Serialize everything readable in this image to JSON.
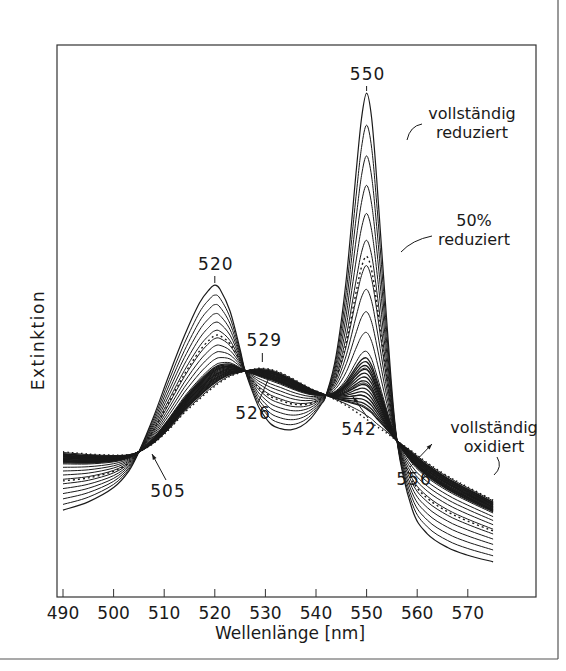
{
  "chart_data": {
    "type": "line",
    "title": "",
    "xlabel": "Wellenlänge [nm]",
    "ylabel": "Extinktion",
    "xlim": [
      490,
      575
    ],
    "ylim": [
      0,
      100
    ],
    "grid": false,
    "legend": "none (inline annotations)",
    "x_ticks": [
      490,
      500,
      510,
      520,
      530,
      540,
      550,
      560,
      570
    ],
    "y_ticks": [],
    "n_intermediate_curves": 16,
    "x": [
      490,
      495,
      500,
      503,
      505,
      508,
      511,
      514,
      517,
      519,
      520,
      521,
      523,
      525,
      526,
      528,
      529,
      531,
      533,
      535,
      537,
      539,
      541,
      542,
      544,
      546,
      548,
      549,
      550,
      551,
      552,
      554,
      556,
      559,
      562,
      566,
      570,
      575
    ],
    "series": [
      {
        "name": "vollständig oxidiert",
        "style": "dotted",
        "values": [
          26.4,
          26.0,
          25.8,
          25.9,
          26.4,
          28.0,
          30.5,
          33.5,
          36.0,
          37.6,
          38.3,
          39.0,
          40.1,
          40.8,
          41.1,
          41.5,
          41.6,
          41.4,
          40.8,
          39.9,
          38.9,
          37.9,
          37.1,
          36.7,
          35.8,
          34.8,
          33.6,
          33.0,
          32.3,
          31.7,
          31.0,
          29.8,
          28.4,
          26.5,
          24.4,
          22.0,
          20.0,
          17.6
        ]
      },
      {
        "name": "vollständig reduziert",
        "style": "solid",
        "values": [
          15.8,
          17.3,
          19.9,
          22.9,
          26.4,
          33.0,
          40.5,
          47.5,
          53.5,
          56.0,
          56.7,
          56.0,
          52.0,
          45.0,
          41.1,
          36.0,
          34.0,
          31.5,
          30.6,
          30.4,
          31.0,
          32.5,
          35.0,
          36.7,
          44.0,
          58.0,
          78.0,
          87.0,
          91.6,
          87.0,
          76.0,
          50.0,
          28.4,
          16.0,
          11.5,
          9.0,
          7.6,
          6.4
        ]
      },
      {
        "name": "50% reduziert",
        "style": "dotted",
        "interpolation": 0.5
      }
    ],
    "isosbestic_points": [
      {
        "nm": 505,
        "label": "505"
      },
      {
        "nm": 526,
        "label": "526"
      },
      {
        "nm": 542,
        "label": "542"
      },
      {
        "nm": 556,
        "label": "556"
      }
    ],
    "peak_labels": [
      {
        "nm": 520,
        "label": "520"
      },
      {
        "nm": 529,
        "label": "529"
      },
      {
        "nm": 550,
        "label": "550"
      }
    ],
    "annotations": [
      {
        "text": [
          "vollständig",
          "reduziert"
        ],
        "target": "vollständig reduziert"
      },
      {
        "text": [
          "50%",
          "reduziert"
        ],
        "target": "50% reduziert"
      },
      {
        "text": [
          "vollständig",
          "oxidiert"
        ],
        "target": "vollständig oxidiert"
      }
    ]
  },
  "colors": {
    "ink": "#1a1a1a",
    "frame": "#555555",
    "background": "#ffffff"
  }
}
